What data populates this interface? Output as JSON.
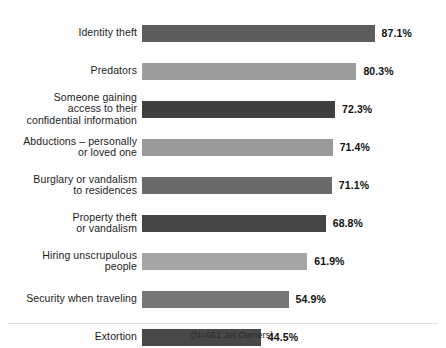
{
  "chart_data": {
    "type": "bar",
    "orientation": "horizontal",
    "title": "",
    "xlabel": "",
    "ylabel": "",
    "xlim": [
      0,
      100
    ],
    "grid": false,
    "legend": null,
    "footnote": "(N=661 Jet Owners)",
    "value_suffix": "%",
    "categories": [
      "Identity theft",
      "Predators",
      "Someone gaining\naccess to their\nconfidential information",
      "Abductions – personally\nor loved one",
      "Burglary or vandalism\nto residences",
      "Property theft\nor vandalism",
      "Hiring unscrupulous\npeople",
      "Security when traveling",
      "Extortion"
    ],
    "values": [
      87.1,
      80.3,
      72.3,
      71.4,
      71.1,
      68.8,
      61.9,
      54.9,
      44.5
    ],
    "value_labels": [
      "87.1%",
      "80.3%",
      "72.3%",
      "71.4%",
      "71.1%",
      "68.8%",
      "61.9%",
      "54.9%",
      "44.5%"
    ],
    "bar_colors": [
      "#5d5d5d",
      "#9d9d9d",
      "#3f3f3f",
      "#9a9a9a",
      "#6a6a6a",
      "#454545",
      "#a6a6a6",
      "#777777",
      "#484848"
    ]
  },
  "colors": {
    "background": "#fefefe",
    "label_text": "#1c1c1c",
    "value_text": "#111111",
    "baseline": "#e2e2e2"
  }
}
